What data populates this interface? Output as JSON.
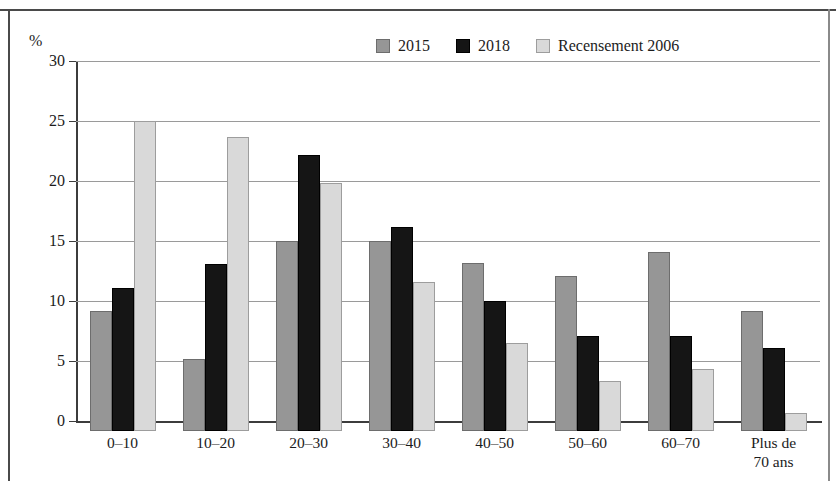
{
  "axis": {
    "unit_label": "%",
    "y_ticks": [
      0,
      5,
      10,
      15,
      20,
      25,
      30
    ]
  },
  "legend": {
    "items": [
      {
        "label": "2015",
        "color": "#969696",
        "key": "s2015"
      },
      {
        "label": "2018",
        "color": "#151515",
        "key": "s2018"
      },
      {
        "label": "Recensement 2006",
        "color": "#d9d9d9",
        "key": "s2006"
      }
    ]
  },
  "chart_data": {
    "type": "bar",
    "title": "",
    "xlabel": "",
    "ylabel": "%",
    "ylim": [
      0,
      30
    ],
    "grid": true,
    "legend_position": "top-right",
    "categories": [
      "0–10",
      "10–20",
      "20–30",
      "30–40",
      "40–50",
      "50–60",
      "60–70",
      "Plus de\n70 ans"
    ],
    "series": [
      {
        "name": "2015",
        "color": "#969696",
        "values": [
          10.0,
          6.0,
          15.8,
          15.8,
          14.0,
          12.9,
          14.9,
          10.0
        ]
      },
      {
        "name": "2018",
        "color": "#151515",
        "values": [
          11.9,
          13.9,
          23.0,
          17.0,
          10.8,
          7.9,
          7.9,
          6.9
        ]
      },
      {
        "name": "Recensement 2006",
        "color": "#d9d9d9",
        "values": [
          25.8,
          24.5,
          20.7,
          12.4,
          7.3,
          4.2,
          5.2,
          1.5
        ]
      }
    ]
  }
}
